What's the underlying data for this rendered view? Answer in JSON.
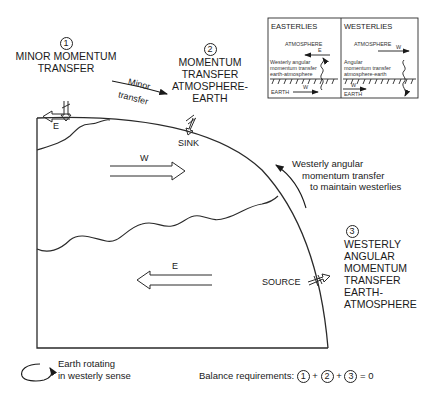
{
  "figure": {
    "annotations": {
      "minor_transfer_marker": "1",
      "minor_transfer_label": [
        "MINOR MOMENTUM",
        "TRANSFER"
      ],
      "atm_earth_marker": "2",
      "atm_earth_label": [
        "MOMENTUM",
        "TRANSFER",
        "ATMOSPHERE-",
        "EARTH"
      ],
      "minor_arrow_label": [
        "Minor",
        "transfer"
      ],
      "sink_label": "SINK",
      "source_label": "SOURCE",
      "earth_atm_marker": "3",
      "earth_atm_label": [
        "WESTERLY",
        "ANGULAR",
        "MOMENTUM",
        "TRANSFER",
        "EARTH-",
        "ATMOSPHERE"
      ],
      "westerly_transfer_note": [
        "Westerly angular",
        "momentum transfer",
        "to maintain westerlies"
      ]
    },
    "wind_zones": {
      "polar": {
        "direction": "E"
      },
      "mid_latitude": {
        "direction": "W"
      },
      "tropical": {
        "direction": "E"
      }
    },
    "inset": {
      "easterlies": {
        "title": "EASTERLIES",
        "atmosphere_label": "ATMOSPHERE",
        "atmosphere_wind": "E",
        "transfer_text": [
          "Westerly angular",
          "momentum transfer",
          "earth-atmosphere"
        ],
        "earth_label": "EARTH",
        "earth_wind": "W"
      },
      "westerlies": {
        "title": "WESTERLIES",
        "atmosphere_label": "ATMOSPHERE",
        "atmosphere_wind": "W",
        "transfer_text": [
          "Angular",
          "momentum transfer",
          "atmosphere-earth"
        ],
        "earth_label": "EARTH",
        "earth_wind": "W"
      }
    },
    "legend": {
      "rotation_text": [
        "Earth rotating",
        "in westerly sense"
      ],
      "balance_prefix": "Balance requirements:",
      "balance_terms": [
        "1",
        "2",
        "3"
      ],
      "plus": "+",
      "equals": "= 0"
    }
  }
}
